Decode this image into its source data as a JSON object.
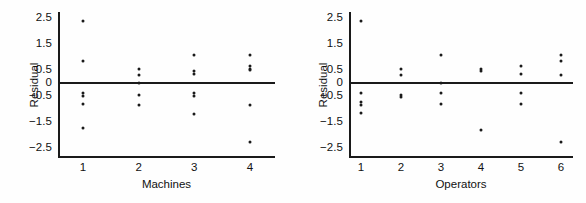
{
  "figure": {
    "background": "#fefefe",
    "ink": "#1a1a1a",
    "panel_count": 2
  },
  "panels": [
    {
      "id": "machines",
      "name": "residual-plot-machines",
      "xlabel": "Machines",
      "ylabel": "Residual"
    },
    {
      "id": "operators",
      "name": "residual-plot-operators",
      "xlabel": "Operators",
      "ylabel": "Residual"
    }
  ],
  "chart_data": [
    {
      "type": "scatter",
      "title": "",
      "xlabel": "Machines",
      "ylabel": "Residual",
      "xlim": [
        0.55,
        4.45
      ],
      "ylim": [
        -2.9,
        2.75
      ],
      "xticks": [
        1,
        2,
        3,
        4
      ],
      "xticklabels": [
        "1",
        "2",
        "3",
        "4"
      ],
      "yticks": [
        2.5,
        1.5,
        0.5,
        0,
        -0.5,
        -1.5,
        -2.5
      ],
      "yticklabels": [
        "2.5",
        "1.5",
        "0.5",
        "0",
        "−0.5",
        "−1.5",
        "−2.5"
      ],
      "grid": false,
      "legend": null,
      "reference_line": {
        "y": 0,
        "style": "solid"
      },
      "points": [
        {
          "x": 1,
          "y": 2.4
        },
        {
          "x": 1,
          "y": 0.85
        },
        {
          "x": 1,
          "y": -0.4
        },
        {
          "x": 1,
          "y": -0.5
        },
        {
          "x": 1,
          "y": -0.8
        },
        {
          "x": 1,
          "y": -1.75
        },
        {
          "x": 2,
          "y": 0.55
        },
        {
          "x": 2,
          "y": 0.3
        },
        {
          "x": 2,
          "y": 0.0
        },
        {
          "x": 2,
          "y": -0.45
        },
        {
          "x": 2,
          "y": -0.85
        },
        {
          "x": 3,
          "y": 1.1
        },
        {
          "x": 3,
          "y": 0.45
        },
        {
          "x": 3,
          "y": 0.35
        },
        {
          "x": 3,
          "y": -0.4
        },
        {
          "x": 3,
          "y": -0.5
        },
        {
          "x": 3,
          "y": -1.2
        },
        {
          "x": 4,
          "y": 1.1
        },
        {
          "x": 4,
          "y": 0.65
        },
        {
          "x": 4,
          "y": 0.55
        },
        {
          "x": 4,
          "y": 0.5
        },
        {
          "x": 4,
          "y": -0.85
        },
        {
          "x": 4,
          "y": -2.3
        }
      ]
    },
    {
      "type": "scatter",
      "title": "",
      "xlabel": "Operators",
      "ylabel": "Residual",
      "xlim": [
        0.7,
        6.3
      ],
      "ylim": [
        -2.9,
        2.75
      ],
      "xticks": [
        1,
        2,
        3,
        4,
        5,
        6
      ],
      "xticklabels": [
        "1",
        "2",
        "3",
        "4",
        "5",
        "6"
      ],
      "yticks": [
        2.5,
        1.5,
        0.5,
        0,
        -0.5,
        -1.5,
        -2.5
      ],
      "yticklabels": [
        "2.5",
        "1.5",
        "0.5",
        "0",
        "−0.5",
        "−1.5",
        "−2.5"
      ],
      "grid": false,
      "legend": null,
      "reference_line": {
        "y": 0,
        "style": "solid"
      },
      "points": [
        {
          "x": 1,
          "y": 2.4
        },
        {
          "x": 1,
          "y": -0.4
        },
        {
          "x": 1,
          "y": -0.75
        },
        {
          "x": 1,
          "y": -0.85
        },
        {
          "x": 1,
          "y": -1.15
        },
        {
          "x": 2,
          "y": 0.55
        },
        {
          "x": 2,
          "y": 0.3
        },
        {
          "x": 2,
          "y": -0.45
        },
        {
          "x": 2,
          "y": -0.55
        },
        {
          "x": 3,
          "y": 1.1
        },
        {
          "x": 3,
          "y": 0.0
        },
        {
          "x": 3,
          "y": -0.4
        },
        {
          "x": 3,
          "y": -0.8
        },
        {
          "x": 4,
          "y": 0.55
        },
        {
          "x": 4,
          "y": 0.45
        },
        {
          "x": 4,
          "y": -1.8
        },
        {
          "x": 5,
          "y": 0.65
        },
        {
          "x": 5,
          "y": 0.35
        },
        {
          "x": 5,
          "y": -0.4
        },
        {
          "x": 5,
          "y": -0.8
        },
        {
          "x": 6,
          "y": 1.1
        },
        {
          "x": 6,
          "y": 0.85
        },
        {
          "x": 6,
          "y": 0.3
        },
        {
          "x": 6,
          "y": -2.3
        }
      ]
    }
  ]
}
